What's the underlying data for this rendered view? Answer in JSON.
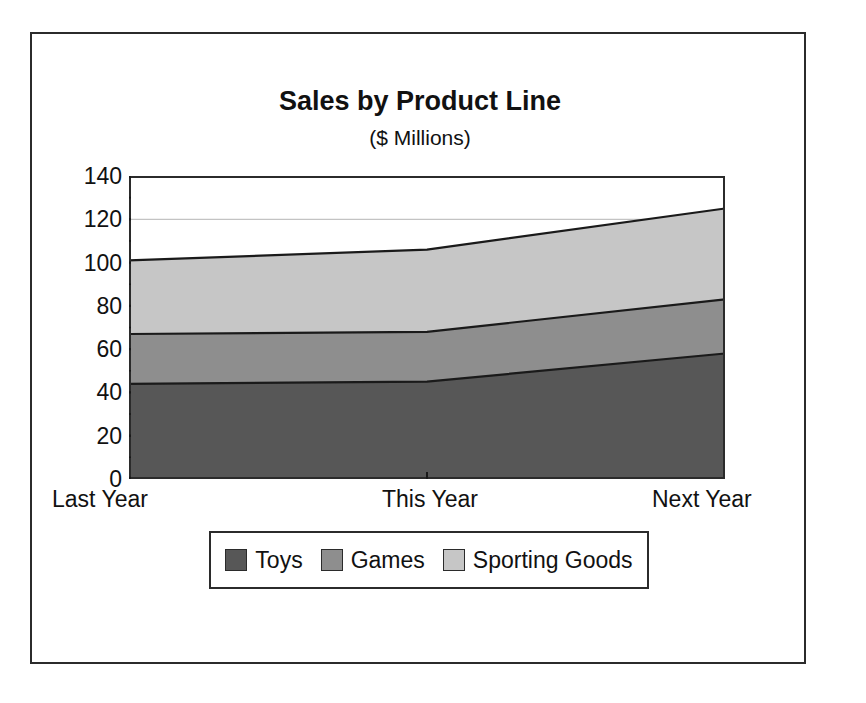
{
  "figure": {
    "title": "Sales by Product Line",
    "subtitle": "($ Millions)"
  },
  "legend": {
    "items": [
      {
        "label": "Toys",
        "color": "#575757"
      },
      {
        "label": "Games",
        "color": "#8e8e8e"
      },
      {
        "label": "Sporting Goods",
        "color": "#c6c6c6"
      }
    ]
  },
  "axes": {
    "y_ticks": [
      "0",
      "20",
      "40",
      "60",
      "80",
      "100",
      "120",
      "140"
    ],
    "x_ticks": [
      "Last Year",
      "This Year",
      "Next Year"
    ]
  },
  "colors": {
    "toys": "#575757",
    "games": "#8e8e8e",
    "sporting_goods": "#c6c6c6",
    "line": "#1a1a1a",
    "frame": "#2b2b2b",
    "gridline": "#b5b5b5",
    "background": "#ffffff"
  },
  "chart_data": {
    "type": "area",
    "stacked": true,
    "title": "Sales by Product Line",
    "subtitle": "($ Millions)",
    "xlabel": "",
    "ylabel": "",
    "categories": [
      "Last Year",
      "This Year",
      "Next Year"
    ],
    "series": [
      {
        "name": "Toys",
        "values": [
          44,
          45,
          58
        ],
        "color": "#575757"
      },
      {
        "name": "Games",
        "values": [
          23,
          23,
          25
        ],
        "color": "#8e8e8e"
      },
      {
        "name": "Sporting Goods",
        "values": [
          34,
          38,
          42
        ],
        "color": "#c6c6c6"
      }
    ],
    "cumulative_totals": {
      "toys": [
        44,
        45,
        58
      ],
      "toys_plus_games": [
        67,
        68,
        83
      ],
      "grand_total": [
        101,
        106,
        125
      ]
    },
    "ylim": [
      0,
      140
    ],
    "ytick_step": 20,
    "yminor_tick_step": 10,
    "grid": true,
    "grid_axis": "y",
    "legend_position": "bottom"
  }
}
